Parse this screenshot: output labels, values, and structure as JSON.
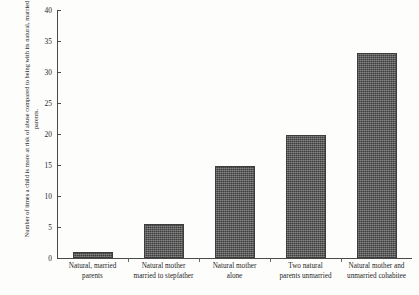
{
  "chart_data": {
    "type": "bar",
    "title": "",
    "xlabel": "",
    "ylabel": "Number of times a child is more at risk of abuse compared to being with its natural, married parents.",
    "categories": [
      "Natural, married parents",
      "Natural mother married to stepfather",
      "Natural mother alone",
      "Two natural parents unmarried",
      "Natural mother and unmarried cohabitee"
    ],
    "values": [
      1,
      5.5,
      14.8,
      19.9,
      33
    ],
    "ylim": [
      0,
      40
    ],
    "yticks": [
      0,
      5,
      10,
      15,
      20,
      25,
      30,
      35,
      40
    ],
    "grid": false,
    "legend": false,
    "bar_color": "#565656"
  },
  "axis": {
    "tick_labels": [
      "0",
      "5",
      "10",
      "15",
      "20",
      "25",
      "30",
      "35",
      "40"
    ]
  },
  "category_lines": [
    [
      "Natural, married",
      "parents"
    ],
    [
      "Natural mother",
      "married to stepfather"
    ],
    [
      "Natural mother",
      "alone"
    ],
    [
      "Two natural",
      "parents unmarried"
    ],
    [
      "Natural mother and",
      "unmarried cohabitee"
    ]
  ]
}
